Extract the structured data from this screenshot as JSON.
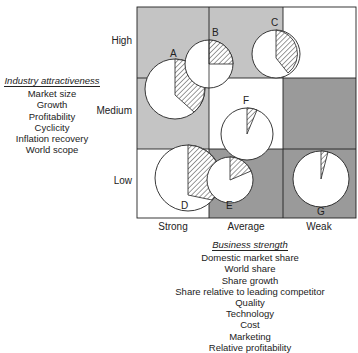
{
  "diagram": {
    "type": "GE-McKinsey nine-box business portfolio matrix",
    "y_axis": {
      "title": "Industry attractiveness",
      "levels": [
        "High",
        "Medium",
        "Low"
      ],
      "factors": [
        "Market size",
        "Growth",
        "Profitability",
        "Cyclicity",
        "Inflation recovery",
        "World scope"
      ]
    },
    "x_axis": {
      "title": "Business strength",
      "levels": [
        "Strong",
        "Average",
        "Weak"
      ],
      "factors": [
        "Domestic market share",
        "World share",
        "Share growth",
        "Share relative to leading competitor",
        "Quality",
        "Technology",
        "Cost",
        "Marketing",
        "Relative profitability"
      ]
    },
    "colors": {
      "light_gray": "#c4c4c4",
      "dark_gray": "#9a9a9a",
      "white": "#ffffff",
      "line": "#222222"
    },
    "cells": [
      {
        "row": "High",
        "col": "Strong",
        "shade": "light"
      },
      {
        "row": "High",
        "col": "Average",
        "shade": "light"
      },
      {
        "row": "High",
        "col": "Weak",
        "shade": "white"
      },
      {
        "row": "Medium",
        "col": "Strong",
        "shade": "light"
      },
      {
        "row": "Medium",
        "col": "Average",
        "shade": "white"
      },
      {
        "row": "Medium",
        "col": "Weak",
        "shade": "dark"
      },
      {
        "row": "Low",
        "col": "Strong",
        "shade": "white"
      },
      {
        "row": "Low",
        "col": "Average",
        "shade": "dark"
      },
      {
        "row": "Low",
        "col": "Weak",
        "shade": "dark"
      }
    ],
    "businesses": [
      {
        "label": "A"
      },
      {
        "label": "B"
      },
      {
        "label": "C"
      },
      {
        "label": "D"
      },
      {
        "label": "E"
      },
      {
        "label": "F"
      },
      {
        "label": "G"
      }
    ]
  }
}
